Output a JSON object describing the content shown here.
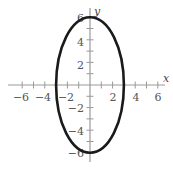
{
  "chart_data": {
    "type": "line",
    "title": "",
    "xlabel": "x",
    "ylabel": "y",
    "xlim": [
      -7,
      7
    ],
    "ylim": [
      -7,
      7
    ],
    "grid": false,
    "x_ticks": [
      -6,
      -4,
      -2,
      2,
      4,
      6
    ],
    "y_ticks": [
      -6,
      -4,
      -2,
      2,
      4,
      6
    ],
    "x_minor_step": 1,
    "y_minor_step": 1,
    "series": [
      {
        "name": "ellipse",
        "shape": "ellipse",
        "equation": "x^2/9 + y^2/36 = 1",
        "center": [
          0,
          0
        ],
        "semi_axis_x": 3,
        "semi_axis_y": 6,
        "color": "#1a1a1a"
      }
    ]
  },
  "labels": {
    "x_axis": "x",
    "y_axis": "y",
    "x_ticks": [
      "−6",
      "−4",
      "−2",
      "2",
      "4",
      "6"
    ],
    "y_ticks": [
      "6",
      "4",
      "2",
      "−2",
      "−4",
      "−6"
    ]
  },
  "colors": {
    "axis": "#9a9a9a",
    "curve": "#1a1a1a",
    "text": "#555555"
  }
}
